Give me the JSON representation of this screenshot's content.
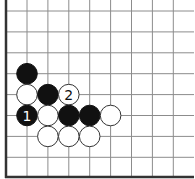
{
  "board": {
    "width": 195,
    "height": 179,
    "origin_x": 6,
    "origin_y": 177,
    "spacing": 20.9,
    "first_col_x": 27,
    "first_row_y": 11,
    "columns": 8,
    "rows": 8,
    "right_extent": 194,
    "top_extent": 0,
    "edges": [
      "left",
      "bottom"
    ],
    "stone_radius": 10.3,
    "colors": {
      "black": "#111111",
      "white": "#ffffff",
      "grid": "#8c8c8c",
      "edge": "#333333"
    }
  },
  "stones": [
    {
      "color": "black",
      "col": 0,
      "row": 3,
      "label": ""
    },
    {
      "color": "white",
      "col": 0,
      "row": 4,
      "label": ""
    },
    {
      "color": "black",
      "col": 1,
      "row": 4,
      "label": ""
    },
    {
      "color": "white",
      "col": 2,
      "row": 4,
      "label": "2"
    },
    {
      "color": "black",
      "col": 0,
      "row": 5,
      "label": "1"
    },
    {
      "color": "white",
      "col": 1,
      "row": 5,
      "label": ""
    },
    {
      "color": "black",
      "col": 2,
      "row": 5,
      "label": ""
    },
    {
      "color": "black",
      "col": 3,
      "row": 5,
      "label": ""
    },
    {
      "color": "white",
      "col": 4,
      "row": 5,
      "label": ""
    },
    {
      "color": "white",
      "col": 1,
      "row": 6,
      "label": ""
    },
    {
      "color": "white",
      "col": 2,
      "row": 6,
      "label": ""
    },
    {
      "color": "white",
      "col": 3,
      "row": 6,
      "label": ""
    }
  ]
}
